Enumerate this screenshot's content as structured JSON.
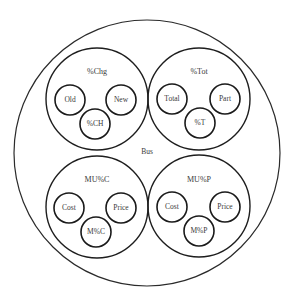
{
  "diagram": {
    "type": "nested-circles",
    "outer": {
      "label": "Bus",
      "cx": 147,
      "cy": 153,
      "r": 133,
      "label_pos": [
        147,
        152
      ]
    },
    "groups": [
      {
        "label": "%Chg",
        "cx": 97,
        "cy": 99,
        "r": 51,
        "label_pos": [
          97,
          72
        ],
        "items": [
          {
            "label": "Old",
            "cx": 70,
            "cy": 100,
            "r": 15
          },
          {
            "label": "New",
            "cx": 121,
            "cy": 100,
            "r": 15
          },
          {
            "label": "%CH",
            "cx": 95,
            "cy": 124,
            "r": 15
          }
        ]
      },
      {
        "label": "%Tot",
        "cx": 199,
        "cy": 99,
        "r": 51,
        "label_pos": [
          199,
          72
        ],
        "items": [
          {
            "label": "Total",
            "cx": 172,
            "cy": 99,
            "r": 15
          },
          {
            "label": "Part",
            "cx": 225,
            "cy": 99,
            "r": 15
          },
          {
            "label": "%T",
            "cx": 200,
            "cy": 123,
            "r": 15
          }
        ]
      },
      {
        "label": "MU%C",
        "cx": 97,
        "cy": 207,
        "r": 51,
        "label_pos": [
          97,
          180
        ],
        "items": [
          {
            "label": "Cost",
            "cx": 69,
            "cy": 208,
            "r": 15
          },
          {
            "label": "Price",
            "cx": 121,
            "cy": 208,
            "r": 15
          },
          {
            "label": "M%C",
            "cx": 96,
            "cy": 232,
            "r": 15
          }
        ]
      },
      {
        "label": "MU%P",
        "cx": 199,
        "cy": 206,
        "r": 51,
        "label_pos": [
          199,
          180
        ],
        "items": [
          {
            "label": "Cost",
            "cx": 172,
            "cy": 207,
            "r": 15
          },
          {
            "label": "Price",
            "cx": 225,
            "cy": 207,
            "r": 15
          },
          {
            "label": "M%P",
            "cx": 199,
            "cy": 231,
            "r": 15
          }
        ]
      }
    ]
  }
}
